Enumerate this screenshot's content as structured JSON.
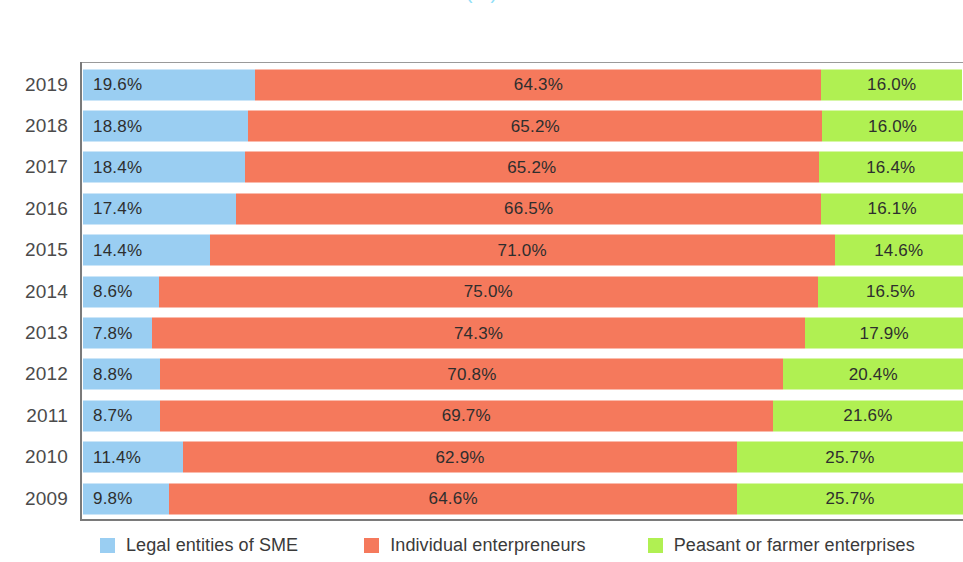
{
  "chart_data": {
    "type": "bar",
    "subtype": "horizontal-100-percent-stacked",
    "title": "(%)",
    "title_note": "Chart heading is cropped off the top edge of the screenshot; only the unit line \"(%)\" is legible.",
    "xlabel": "",
    "ylabel": "",
    "xlim": [
      0,
      100
    ],
    "grid": false,
    "legend_position": "bottom",
    "categories": [
      "2019",
      "2018",
      "2017",
      "2016",
      "2015",
      "2014",
      "2013",
      "2012",
      "2011",
      "2010",
      "2009"
    ],
    "series": [
      {
        "name": "Legal entities of SME",
        "color": "#9ACEF2",
        "values": [
          19.6,
          18.8,
          18.4,
          17.4,
          14.4,
          8.6,
          7.8,
          8.8,
          8.7,
          11.4,
          9.8
        ],
        "labels": [
          "19.6%",
          "18.8%",
          "18.4%",
          "17.4%",
          "14.4%",
          "8.6%",
          "7.8%",
          "8.8%",
          "8.7%",
          "11.4%",
          "9.8%"
        ]
      },
      {
        "name": "Individual enterpreneurs",
        "color": "#F5795C",
        "values": [
          64.3,
          65.2,
          65.2,
          66.5,
          71.0,
          75.0,
          74.3,
          70.8,
          69.7,
          62.9,
          64.6
        ],
        "labels": [
          "64.3%",
          "65.2%",
          "65.2%",
          "66.5%",
          "71.0%",
          "75.0%",
          "74.3%",
          "70.8%",
          "69.7%",
          "62.9%",
          "64.6%"
        ]
      },
      {
        "name": "Peasant or farmer enterprises",
        "color": "#B0F052",
        "values": [
          16.0,
          16.0,
          16.4,
          16.1,
          14.6,
          16.5,
          17.9,
          20.4,
          21.6,
          25.7,
          25.7
        ],
        "labels": [
          "16.0%",
          "16.0%",
          "16.4%",
          "16.1%",
          "14.6%",
          "16.5%",
          "17.9%",
          "20.4%",
          "21.6%",
          "25.7%",
          "25.7%"
        ]
      }
    ]
  },
  "legend": {
    "items": [
      {
        "label": "Legal entities of SME",
        "color": "#9ACEF2",
        "swatch_class": "sw-legal"
      },
      {
        "label": "Individual enterpreneurs",
        "color": "#F5795C",
        "swatch_class": "sw-indiv"
      },
      {
        "label": "Peasant or farmer enterprises",
        "color": "#B0F052",
        "swatch_class": "sw-peasant"
      }
    ]
  },
  "colors": {
    "legal_entities": "#9ACEF2",
    "individual_entrepreneurs": "#F5795C",
    "peasant_farmer": "#B0F052",
    "title": "#39C6F3",
    "axis": "#7a7a7a",
    "label_text": "#4b4b4b"
  }
}
